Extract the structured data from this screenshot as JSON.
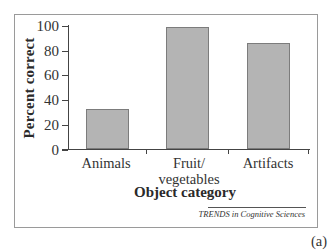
{
  "chart_data": {
    "type": "bar",
    "title": "",
    "xlabel": "Object category",
    "ylabel": "Percent correct",
    "categories": [
      "Animals",
      "Fruit/ vegetables",
      "Artifacts"
    ],
    "category_lines": [
      [
        "Animals"
      ],
      [
        "Fruit/",
        "vegetables"
      ],
      [
        "Artifacts"
      ]
    ],
    "values": [
      33,
      99,
      86
    ],
    "ylim": [
      0,
      100
    ],
    "yticks": [
      0,
      20,
      40,
      60,
      80,
      100
    ],
    "grid": false,
    "legend": null,
    "bar_color": "#b4b4b4",
    "bar_edge_color": "#7c7c7c"
  },
  "figure": {
    "credit": "TRENDS in Cognitive Sciences",
    "panel_label": "(a)"
  }
}
